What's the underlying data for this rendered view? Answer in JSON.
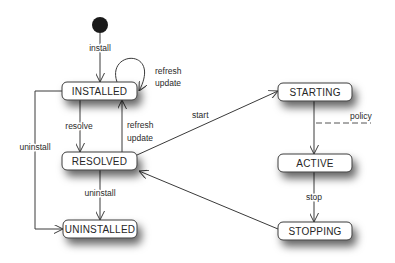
{
  "diagram": {
    "type": "state-machine",
    "states": {
      "installed": "INSTALLED",
      "resolved": "RESOLVED",
      "uninstalled": "UNINSTALLED",
      "starting": "STARTING",
      "active": "ACTIVE",
      "stopping": "STOPPING"
    },
    "transitions": {
      "install": "install",
      "installed_self": [
        "refresh",
        "update"
      ],
      "resolve": "resolve",
      "resolved_to_installed": [
        "refresh",
        "update"
      ],
      "uninstall_from_installed": "uninstall",
      "uninstall_from_resolved": "uninstall",
      "start": "start",
      "policy": "policy",
      "stop": "stop"
    },
    "edges": [
      {
        "from": "initial",
        "to": "INSTALLED",
        "label": "install"
      },
      {
        "from": "INSTALLED",
        "to": "INSTALLED",
        "label": "refresh update"
      },
      {
        "from": "INSTALLED",
        "to": "RESOLVED",
        "label": "resolve"
      },
      {
        "from": "RESOLVED",
        "to": "INSTALLED",
        "label": "refresh update"
      },
      {
        "from": "INSTALLED",
        "to": "UNINSTALLED",
        "label": "uninstall"
      },
      {
        "from": "RESOLVED",
        "to": "UNINSTALLED",
        "label": "uninstall"
      },
      {
        "from": "RESOLVED",
        "to": "STARTING",
        "label": "start"
      },
      {
        "from": "STARTING",
        "to": "ACTIVE",
        "label": "policy"
      },
      {
        "from": "ACTIVE",
        "to": "STOPPING",
        "label": "stop"
      },
      {
        "from": "STOPPING",
        "to": "RESOLVED",
        "label": ""
      }
    ],
    "colors": {
      "line": "#3a3a3a",
      "box_fill": "#ffffff",
      "initial_node": "#1a1a1a",
      "shadow": "#000000"
    }
  }
}
